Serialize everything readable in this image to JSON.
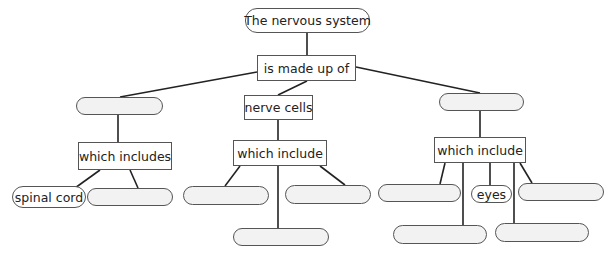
{
  "diagram": {
    "type": "concept-map",
    "colors": {
      "line": "#222222",
      "border": "#555555",
      "empty_fill": "#f2f2f2",
      "text": "#222222"
    },
    "nodes": {
      "root": {
        "label": "The nervous system",
        "shape": "pill"
      },
      "made_up_of": {
        "label": "is made up of",
        "shape": "rect"
      },
      "left_blank": {
        "label": "",
        "shape": "pill"
      },
      "left_which_includes": {
        "label": "which includes",
        "shape": "rect"
      },
      "spinal_cord": {
        "label": "spinal cord",
        "shape": "pill"
      },
      "left_blank_2": {
        "label": "",
        "shape": "pill"
      },
      "nerve_cells": {
        "label": "nerve cells",
        "shape": "rect"
      },
      "mid_which_include": {
        "label": "which include",
        "shape": "rect"
      },
      "mid_blank_left": {
        "label": "",
        "shape": "pill"
      },
      "mid_blank_right": {
        "label": "",
        "shape": "pill"
      },
      "mid_blank_bottom": {
        "label": "",
        "shape": "pill"
      },
      "right_blank": {
        "label": "",
        "shape": "pill"
      },
      "right_which_include": {
        "label": "which include",
        "shape": "rect"
      },
      "right_blank_left": {
        "label": "",
        "shape": "pill"
      },
      "eyes": {
        "label": "eyes",
        "shape": "pill"
      },
      "right_blank_far": {
        "label": "",
        "shape": "pill"
      },
      "right_blank_bottom_left": {
        "label": "",
        "shape": "pill"
      },
      "right_blank_bottom_right": {
        "label": "",
        "shape": "pill"
      }
    }
  }
}
